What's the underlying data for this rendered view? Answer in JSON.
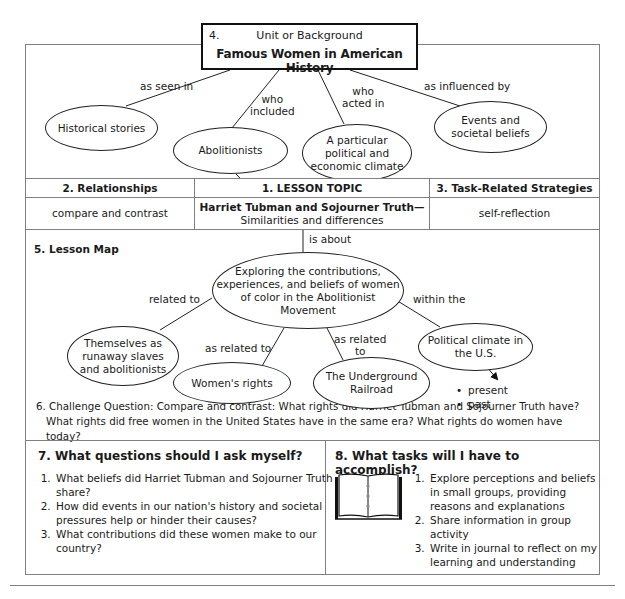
{
  "unit": {
    "number": "4.",
    "label": "Unit or Background",
    "title": "Famous Women in American History"
  },
  "unit_links": [
    {
      "label": "as seen in",
      "node": "Historical stories"
    },
    {
      "label": "who included",
      "node": "Abolitionists"
    },
    {
      "label": "who acted in",
      "node": "A particular political and economic climate"
    },
    {
      "label": "as influenced by",
      "node": "Events and societal beliefs"
    }
  ],
  "unit_labels": {
    "as_seen_in": "as seen in",
    "who_included_1": "who",
    "who_included_2": "included",
    "who_acted_1": "who",
    "who_acted_2": "acted in",
    "influenced_by": "as influenced by"
  },
  "unit_nodes": {
    "historical": "Historical stories",
    "abolitionists": "Abolitionists",
    "climate_1": "A particular",
    "climate_2": "political and",
    "climate_3": "economic climate",
    "events_1": "Events and",
    "events_2": "societal beliefs"
  },
  "table": {
    "headers": {
      "relationships": "2. Relationships",
      "lesson_topic": "1. LESSON TOPIC",
      "strategies": "3. Task-Related Strategies"
    },
    "values": {
      "relationships": "compare and contrast",
      "lesson_topic_line1": "Harriet Tubman and Sojourner Truth—",
      "lesson_topic_line2": "Similarities and differences",
      "strategies": "self-reflection"
    }
  },
  "lesson_map": {
    "title": "5. Lesson Map",
    "is_about": "is about",
    "center": [
      "Exploring the contributions,",
      "experiences, and beliefs of women",
      "of color in the Abolitionist",
      "Movement"
    ],
    "labels": {
      "related_to": "related to",
      "as_related_to": "as related to",
      "as_related_1": "as related",
      "as_related_2": "to",
      "within_the": "within the"
    },
    "nodes": {
      "themselves": [
        "Themselves as",
        "runaway slaves",
        "and abolitionists"
      ],
      "womens_rights": "Women's rights",
      "underground": [
        "The Underground",
        "Railroad"
      ],
      "political": [
        "Political climate in",
        "the U.S."
      ]
    },
    "bullets": [
      "present",
      "past"
    ]
  },
  "challenge": {
    "line1": "6. Challenge Question:  Compare and contrast: What rights did Harriet Tubman and Sojourner Truth have?",
    "line2": "What rights did free women in the United States have in the same era? What rights do women have today?"
  },
  "questions": {
    "title": "7.  What questions should I ask myself?",
    "items": [
      "What beliefs did Harriet Tubman and Sojourner Truth share?",
      "How did events in our nation's history and societal pressures help or hinder their causes?",
      "What contributions did these women make to our country?"
    ]
  },
  "tasks": {
    "title": "8. What tasks will I have to accomplish?",
    "icon": "open-book-icon",
    "items": [
      "Explore perceptions and beliefs in small groups, providing reasons and explanations",
      "Share information in group activity",
      "Write in journal to reflect on my learning and understanding"
    ]
  },
  "colors": {
    "line": "#222222",
    "border": "#808080",
    "text": "#1a1a1a"
  }
}
